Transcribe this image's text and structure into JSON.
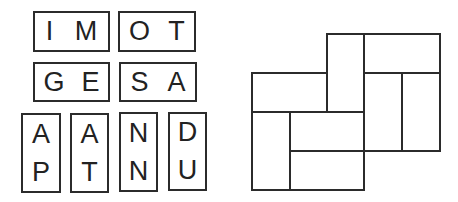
{
  "tiles": [
    {
      "letters": [
        "I",
        "M"
      ],
      "orientation": "horizontal"
    },
    {
      "letters": [
        "O",
        "T"
      ],
      "orientation": "horizontal"
    },
    {
      "letters": [
        "G",
        "E"
      ],
      "orientation": "horizontal"
    },
    {
      "letters": [
        "S",
        "A"
      ],
      "orientation": "horizontal"
    },
    {
      "letters": [
        "A",
        "P"
      ],
      "orientation": "vertical"
    },
    {
      "letters": [
        "A",
        "T"
      ],
      "orientation": "vertical"
    },
    {
      "letters": [
        "N",
        "N"
      ],
      "orientation": "vertical"
    },
    {
      "letters": [
        "D",
        "U"
      ],
      "orientation": "vertical"
    }
  ],
  "diagram": {
    "line_color": "#2b2b2b",
    "cells": 8
  }
}
